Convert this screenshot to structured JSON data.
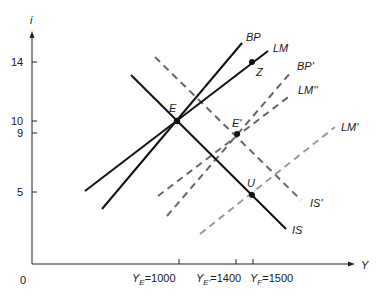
{
  "diagram": {
    "axes": {
      "y_label": "i",
      "x_label": "Y",
      "origin_label": "0",
      "y_ticks": [
        {
          "label": "14",
          "value": 14
        },
        {
          "label": "10",
          "value": 10
        },
        {
          "label": "9",
          "value": 9
        },
        {
          "label": "5",
          "value": 5
        }
      ],
      "x_ticks": [
        {
          "main": "Y",
          "sub": "E",
          "rest": "=1000",
          "value": 1000
        },
        {
          "main": "Y",
          "sub": "E'",
          "rest": "=1400",
          "value": 1400
        },
        {
          "main": "Y",
          "sub": "F",
          "rest": "=1500",
          "value": 1500
        }
      ]
    },
    "curves": [
      {
        "id": "BP",
        "label": "BP",
        "style": "solid",
        "color": "#111111"
      },
      {
        "id": "LM",
        "label": "LM",
        "style": "solid",
        "color": "#111111"
      },
      {
        "id": "IS",
        "label": "IS",
        "style": "solid",
        "color": "#111111"
      },
      {
        "id": "IS_prime",
        "label": "IS'",
        "style": "dashed",
        "color": "#666666"
      },
      {
        "id": "BP_prime",
        "label": "BP'",
        "style": "dashed",
        "color": "#666666"
      },
      {
        "id": "LM_double_prime",
        "label": "LM''",
        "style": "dashed",
        "color": "#666666"
      },
      {
        "id": "LM_prime",
        "label": "LM'",
        "style": "dashed",
        "color": "#9a9a9a"
      }
    ],
    "points": [
      {
        "id": "E",
        "label": "E",
        "Y": 1000,
        "i": 10
      },
      {
        "id": "E_prime",
        "label": "E'",
        "Y": 1400,
        "i": 9
      },
      {
        "id": "U",
        "label": "U",
        "Y": 1500,
        "i": 5
      },
      {
        "id": "Z",
        "label": "Z",
        "Y": 1500,
        "i": 14
      }
    ]
  }
}
